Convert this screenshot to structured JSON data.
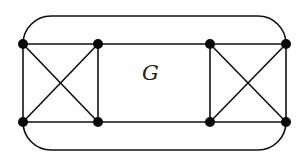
{
  "diagram": {
    "label": "G",
    "colors": {
      "stroke": "#111111",
      "node": "#0a0a0a",
      "background": "#ffffff"
    },
    "nodes": [
      {
        "id": "a",
        "x": 23,
        "y": 44
      },
      {
        "id": "b",
        "x": 98,
        "y": 44
      },
      {
        "id": "c",
        "x": 23,
        "y": 122
      },
      {
        "id": "d",
        "x": 98,
        "y": 122
      },
      {
        "id": "e",
        "x": 210,
        "y": 44
      },
      {
        "id": "f",
        "x": 286,
        "y": 44
      },
      {
        "id": "g",
        "x": 210,
        "y": 122
      },
      {
        "id": "h",
        "x": 286,
        "y": 122
      }
    ],
    "edges": [
      [
        "a",
        "b"
      ],
      [
        "a",
        "c"
      ],
      [
        "b",
        "d"
      ],
      [
        "c",
        "d"
      ],
      [
        "a",
        "d"
      ],
      [
        "b",
        "c"
      ],
      [
        "e",
        "f"
      ],
      [
        "e",
        "g"
      ],
      [
        "f",
        "h"
      ],
      [
        "g",
        "h"
      ],
      [
        "e",
        "h"
      ],
      [
        "f",
        "g"
      ],
      [
        "b",
        "e"
      ],
      [
        "d",
        "g"
      ]
    ],
    "outer_curves": [
      {
        "from": "a",
        "to": "f",
        "side": "top",
        "y": 16
      },
      {
        "from": "c",
        "to": "h",
        "side": "bottom",
        "y": 150
      }
    ]
  }
}
